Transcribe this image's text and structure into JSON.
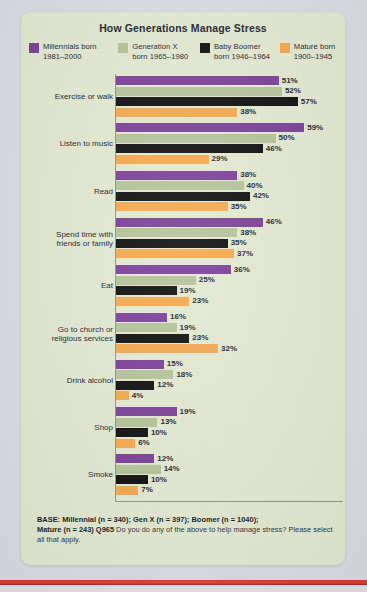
{
  "card": {
    "title": "How Generations Manage Stress",
    "background_color": "#e4ead2",
    "page_background_color": "#dcdce4",
    "accent_rule_color": "#c0392b"
  },
  "legend": {
    "items": [
      {
        "label_line1": "Millennials born",
        "label_line2": "1981–2000",
        "color": "#7B3F98",
        "key": "millennial"
      },
      {
        "label_line1": "Generation X",
        "label_line2": "born 1965–1980",
        "color": "#B5C49A",
        "key": "genx"
      },
      {
        "label_line1": "Baby Boomer",
        "label_line2": "born 1946–1964",
        "color": "#0D0D0D",
        "key": "boomer"
      },
      {
        "label_line1": "Mature born",
        "label_line2": "1900–1945",
        "color": "#F5A94E",
        "key": "mature"
      }
    ]
  },
  "footnote": {
    "bold1": "BASE: Millennial (n = 340); Gen X (n = 397); Boomer (n = 1040);",
    "bold2": "Mature (n = 243) Q965",
    "rest": "Do you do any of the above to help manage stress? Please select all that apply."
  },
  "chart_data": {
    "type": "bar",
    "orientation": "horizontal",
    "grouped": true,
    "title": "How Generations Manage Stress",
    "xlabel": "",
    "ylabel": "",
    "xlim": [
      0,
      60
    ],
    "grid": false,
    "legend_position": "top",
    "value_suffix": "%",
    "categories": [
      "Exercise or walk",
      "Listen to music",
      "Read",
      "Spend time with friends or family",
      "Eat",
      "Go to church or religious services",
      "Drink alcohol",
      "Shop",
      "Smoke"
    ],
    "category_lines": [
      [
        "Exercise or walk"
      ],
      [
        "Listen to music"
      ],
      [
        "Read"
      ],
      [
        "Spend time with",
        "friends or family"
      ],
      [
        "Eat"
      ],
      [
        "Go to church or",
        "religious services"
      ],
      [
        "Drink alcohol"
      ],
      [
        "Shop"
      ],
      [
        "Smoke"
      ]
    ],
    "series": [
      {
        "name": "Millennials born 1981–2000",
        "color": "#7B3F98",
        "values": [
          51,
          59,
          38,
          46,
          36,
          16,
          15,
          19,
          12
        ]
      },
      {
        "name": "Generation X born 1965–1980",
        "color": "#B5C49A",
        "values": [
          52,
          50,
          40,
          38,
          25,
          19,
          18,
          13,
          14
        ]
      },
      {
        "name": "Baby Boomer born 1946–1964",
        "color": "#0D0D0D",
        "values": [
          57,
          46,
          42,
          35,
          19,
          23,
          12,
          10,
          10
        ]
      },
      {
        "name": "Mature born 1900–1945",
        "color": "#F5A94E",
        "values": [
          38,
          29,
          35,
          37,
          23,
          32,
          4,
          6,
          7
        ]
      }
    ],
    "labels": {
      "Exercise or walk": [
        "51%",
        "52%",
        "57%",
        "38%"
      ],
      "Listen to music": [
        "59%",
        "50%",
        "46%",
        "29%"
      ],
      "Read": [
        "38%",
        "40%",
        "42%",
        "35%"
      ],
      "Spend time with friends or family": [
        "46%",
        "38%",
        "35%",
        "37%"
      ],
      "Eat": [
        "36%",
        "25%",
        "19%",
        "23%"
      ],
      "Go to church or religious services": [
        "16%",
        "19%",
        "23%",
        "32%"
      ],
      "Drink alcohol": [
        "15%",
        "18%",
        "12%",
        "4%"
      ],
      "Shop": [
        "19%",
        "13%",
        "10%",
        "6%"
      ],
      "Smoke": [
        "12%",
        "14%",
        "10%",
        "7%"
      ]
    }
  }
}
